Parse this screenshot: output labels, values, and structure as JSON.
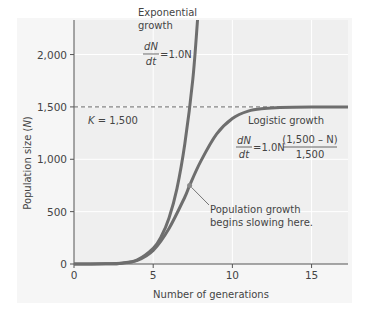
{
  "chart_data": {
    "type": "line",
    "title": "",
    "xlabel": "Number of generations",
    "ylabel": "Population size (N)",
    "xlim": [
      0,
      17.3
    ],
    "ylim": [
      0,
      2330
    ],
    "xticks": [
      0,
      5,
      10,
      15
    ],
    "yticks": [
      0,
      500,
      1000,
      1500,
      2000
    ],
    "xtick_labels": [
      "0",
      "5",
      "10",
      "15"
    ],
    "ytick_labels": [
      "0",
      "500",
      "1,000",
      "1,500",
      "2,000"
    ],
    "grid": true,
    "carrying_capacity": {
      "value": 1500,
      "label": "K = 1,500"
    },
    "series": [
      {
        "name": "Exponential growth",
        "equation": "dN/dt = 1.0N",
        "model": "exponential",
        "r": 1.0,
        "x": [
          0,
          2,
          3,
          4,
          5,
          5.5,
          6,
          6.5,
          7,
          7.5,
          7.8
        ],
        "y": [
          0,
          2,
          8,
          40,
          150,
          260,
          440,
          720,
          1150,
          1760,
          2330
        ]
      },
      {
        "name": "Logistic growth",
        "equation": "dN/dt = 1.0N (1,500 − N)/1,500",
        "model": "logistic",
        "r": 1.0,
        "K": 1500,
        "x": [
          0,
          2,
          3,
          4,
          5,
          6,
          7,
          7.3,
          8,
          9,
          10,
          11,
          12,
          13,
          15,
          17.3
        ],
        "y": [
          0,
          2,
          8,
          35,
          130,
          340,
          640,
          750,
          980,
          1240,
          1390,
          1460,
          1485,
          1495,
          1500,
          1500
        ]
      }
    ],
    "annotations": [
      {
        "text_lines": [
          "Population growth",
          "begins slowing here."
        ],
        "x": 7.3,
        "y": 750
      }
    ],
    "labels": {
      "exponential_title_lines": [
        "Exponential",
        "growth"
      ],
      "logistic_title": "Logistic growth",
      "eq_dN": "dN",
      "eq_dt": "dt",
      "eq_exp_rhs": "=1.0N",
      "eq_log_rhs": "=1.0N",
      "eq_log_num": "(1,500 – N)",
      "eq_log_den": "1,500"
    },
    "colors": {
      "curve": "#6e6e6e",
      "plot_bg": "#efefef",
      "axis": "#555555",
      "dashed": "#666666"
    }
  }
}
